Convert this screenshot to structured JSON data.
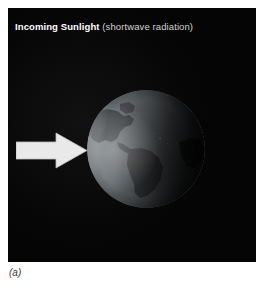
{
  "figure": {
    "label": "(a)",
    "panel": {
      "background_color": "#050505",
      "title_strong": "Incoming Sunlight",
      "title_light": "(shortwave radiation)"
    },
    "arrow": {
      "name": "incoming-sunlight-arrow",
      "direction": "right",
      "color": "#e8e8e8"
    },
    "globe": {
      "name": "earth-globe",
      "visible_hemisphere": "Americas",
      "land_color": "#3c4044",
      "ocean_color": "#6f7579",
      "lit_side": "left",
      "dark_side": "right"
    }
  }
}
